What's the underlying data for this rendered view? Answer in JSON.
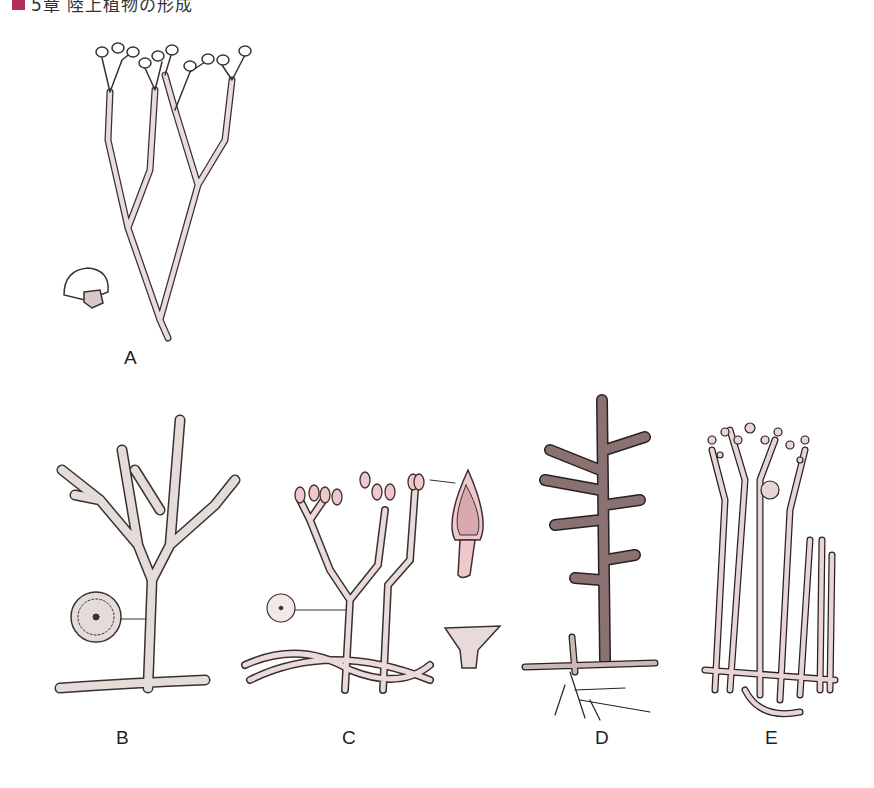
{
  "header": {
    "chapter_text": "5章 陸上植物の形成",
    "marker_color": "#b0305a"
  },
  "figure": {
    "panels": [
      {
        "id": "A",
        "label": "A",
        "description": "dichotomously branched plant with terminal sporangia; detached sporangium inset"
      },
      {
        "id": "B",
        "label": "B",
        "description": "branching axis with spiny surface, terminal sporangia; stem cross-section inset"
      },
      {
        "id": "C",
        "label": "C",
        "description": "branched axes on rhizomes with paired sporangia; sporangium detail and cross-section insets"
      },
      {
        "id": "D",
        "label": "D",
        "description": "scaly axis with lateral branches, rhizome and roots"
      },
      {
        "id": "E",
        "label": "E",
        "description": "cluster of upright warty axes from horizontal rhizome"
      }
    ]
  },
  "colors": {
    "stem_fill": "#e8dcdc",
    "stem_stroke": "#3a3030",
    "sporangium_fill": "#f0c8cc",
    "dark_stem": "#7a6565"
  }
}
